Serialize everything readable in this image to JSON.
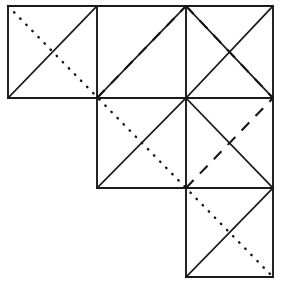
{
  "figure": {
    "background_color": "#ffffff",
    "line_color": "#1a1a1a",
    "width": 284,
    "height": 290,
    "grid": {
      "x_positions": [
        8,
        97,
        186,
        273
      ],
      "y_positions": [
        6,
        98,
        188,
        277
      ],
      "cell_size": 89,
      "description": "Three rows forming a descending staircase: row 1 has 3 squares, row 2 has 2 squares, row 3 has 1 square"
    },
    "squares": [
      {
        "name": "row1-col1",
        "x1": 8,
        "y1": 6,
        "x2": 97,
        "y2": 98
      },
      {
        "name": "row1-col2",
        "x1": 97,
        "y1": 6,
        "x2": 186,
        "y2": 98
      },
      {
        "name": "row1-col3",
        "x1": 186,
        "y1": 6,
        "x2": 273,
        "y2": 98
      },
      {
        "name": "row2-col2",
        "x1": 97,
        "y1": 98,
        "x2": 186,
        "y2": 188
      },
      {
        "name": "row2-col3",
        "x1": 186,
        "y1": 98,
        "x2": 273,
        "y2": 188
      },
      {
        "name": "row3-col3",
        "x1": 186,
        "y1": 188,
        "x2": 273,
        "y2": 277
      }
    ],
    "outline_segments": [
      {
        "name": "outline-top",
        "x1": 8,
        "y1": 6,
        "x2": 273,
        "y2": 6
      },
      {
        "name": "outline-left",
        "x1": 8,
        "y1": 6,
        "x2": 8,
        "y2": 98
      },
      {
        "name": "outline-bottom-row1",
        "x1": 8,
        "y1": 98,
        "x2": 97,
        "y2": 98
      },
      {
        "name": "outline-left-row2",
        "x1": 97,
        "y1": 98,
        "x2": 97,
        "y2": 188
      },
      {
        "name": "outline-bottom-row2",
        "x1": 97,
        "y1": 188,
        "x2": 186,
        "y2": 188
      },
      {
        "name": "outline-left-row3",
        "x1": 186,
        "y1": 188,
        "x2": 186,
        "y2": 277
      },
      {
        "name": "outline-bottom-row3",
        "x1": 186,
        "y1": 277,
        "x2": 273,
        "y2": 277
      },
      {
        "name": "outline-right",
        "x1": 273,
        "y1": 6,
        "x2": 273,
        "y2": 277
      }
    ],
    "interior_segments": [
      {
        "name": "interior-vertical-x97",
        "x1": 97,
        "y1": 6,
        "x2": 97,
        "y2": 98
      },
      {
        "name": "interior-vertical-x186-r1",
        "x1": 186,
        "y1": 6,
        "x2": 186,
        "y2": 98
      },
      {
        "name": "interior-vertical-x186-r2",
        "x1": 186,
        "y1": 98,
        "x2": 186,
        "y2": 188
      },
      {
        "name": "interior-horizontal-y98",
        "x1": 97,
        "y1": 98,
        "x2": 273,
        "y2": 98
      },
      {
        "name": "interior-horizontal-y188",
        "x1": 186,
        "y1": 188,
        "x2": 273,
        "y2": 188
      }
    ],
    "solid_diagonals": [
      {
        "name": "solid-anti-r1c1",
        "x1": 8,
        "y1": 98,
        "x2": 97,
        "y2": 6
      },
      {
        "name": "solid-anti-r1c2",
        "x1": 97,
        "y1": 98,
        "x2": 186,
        "y2": 6
      },
      {
        "name": "solid-anti-r1c3",
        "x1": 186,
        "y1": 98,
        "x2": 273,
        "y2": 6
      },
      {
        "name": "solid-main-r1c3",
        "x1": 186,
        "y1": 6,
        "x2": 273,
        "y2": 98
      },
      {
        "name": "solid-anti-r2c2",
        "x1": 97,
        "y1": 188,
        "x2": 186,
        "y2": 98
      },
      {
        "name": "solid-main-r2c3",
        "x1": 186,
        "y1": 98,
        "x2": 273,
        "y2": 188
      },
      {
        "name": "solid-main-r3c3",
        "x1": 186,
        "y1": 277,
        "x2": 273,
        "y2": 188
      }
    ],
    "dashed_segments": [
      {
        "name": "dashed-up-left",
        "x1": 97,
        "y1": 98,
        "x2": 186,
        "y2": 6
      },
      {
        "name": "dashed-down-right",
        "x1": 186,
        "y1": 6,
        "x2": 273,
        "y2": 98
      },
      {
        "name": "dashed-lower-left",
        "x1": 186,
        "y1": 188,
        "x2": 273,
        "y2": 98
      }
    ],
    "dotted_segments": [
      {
        "name": "dotted-main-diagonal",
        "x1": 8,
        "y1": 6,
        "x2": 273,
        "y2": 277
      }
    ]
  },
  "line_styles": {
    "solid_label": "solid",
    "dashed_label": "dashed",
    "dotted_label": "dotted"
  }
}
